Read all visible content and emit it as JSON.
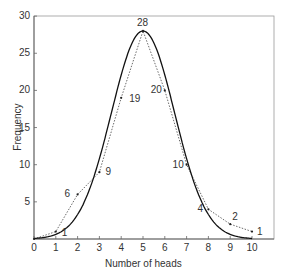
{
  "chart_data": {
    "type": "line",
    "title": "",
    "xlabel": "Number of heads",
    "ylabel": "Frequency",
    "xlim": [
      0,
      10
    ],
    "ylim": [
      0,
      30
    ],
    "x_ticks": [
      "0",
      "1",
      "2",
      "3",
      "4",
      "5",
      "6",
      "7",
      "8",
      "9",
      "10"
    ],
    "y_ticks": [
      "5",
      "10",
      "15",
      "20",
      "25",
      "30"
    ],
    "grid": false,
    "legend": null,
    "series": [
      {
        "name": "Observed frequency",
        "style": "dotted",
        "x": [
          0,
          1,
          2,
          3,
          4,
          5,
          6,
          7,
          8,
          9,
          10
        ],
        "values": [
          0,
          1,
          6,
          9,
          19,
          28,
          20,
          10,
          4,
          2,
          1
        ]
      },
      {
        "name": "Smooth curve",
        "style": "solid",
        "x": [
          0,
          1,
          2,
          3,
          4,
          5,
          6,
          7,
          8,
          9,
          10
        ],
        "values": [
          0,
          1.5,
          4,
          9,
          22,
          28,
          22,
          9,
          4,
          1.5,
          0
        ]
      }
    ],
    "point_labels": [
      "1",
      "6",
      "9",
      "19",
      "28",
      "20",
      "10",
      "4",
      "2",
      "1"
    ]
  }
}
